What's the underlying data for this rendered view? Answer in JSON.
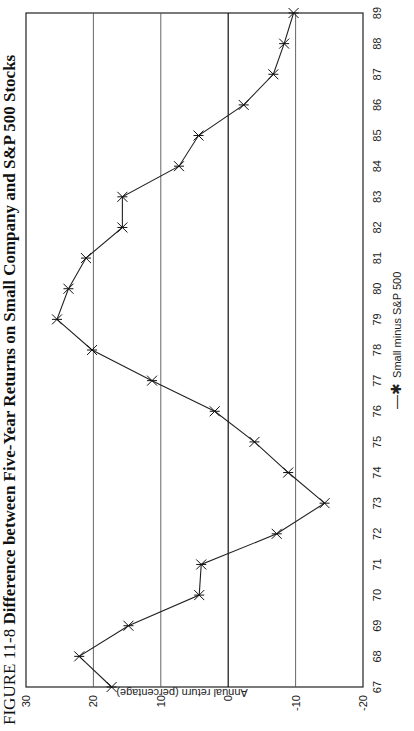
{
  "chart_data": {
    "type": "line",
    "title_prefix": "FIGURE 11-8",
    "title": "Difference between Five-Year Returns on Small Company and S&P 500 Stocks",
    "xlabel": "",
    "ylabel": "Annual return (percentage)",
    "ylim": [
      -20,
      30
    ],
    "yticks": [
      30,
      20,
      10,
      0,
      -10,
      -20
    ],
    "grid": true,
    "legend_position": "bottom",
    "categories": [
      "67",
      "68",
      "69",
      "70",
      "71",
      "72",
      "73",
      "74",
      "75",
      "76",
      "77",
      "78",
      "79",
      "80",
      "81",
      "82",
      "83",
      "84",
      "85",
      "86",
      "87",
      "88",
      "89"
    ],
    "series": [
      {
        "name": "Small minus S&P 500",
        "marker": "asterisk",
        "values": [
          17.3,
          22.1,
          14.8,
          4.3,
          4.0,
          -7.2,
          -14.3,
          -8.9,
          -3.9,
          2.0,
          11.3,
          20.2,
          25.4,
          23.7,
          21.1,
          15.7,
          15.7,
          7.3,
          4.4,
          -2.3,
          -6.7,
          -8.3,
          -9.7
        ]
      }
    ]
  },
  "colors": {
    "line": "#222222",
    "grid": "#555555",
    "background": "#ffffff"
  }
}
